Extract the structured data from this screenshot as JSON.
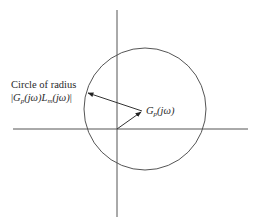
{
  "diagram": {
    "type": "nyquist-uncertainty-disk",
    "labels": {
      "circle_line1": "Circle of radius",
      "radius_expr": {
        "open_bar": "|",
        "G": "G",
        "G_sub": "p",
        "arg1": "(jω)",
        "L": "L",
        "L_sub": "m",
        "arg2": "(jω)",
        "close_bar": "|"
      },
      "point_expr": {
        "G": "G",
        "G_sub": "p",
        "arg": "(jω)"
      }
    },
    "geometry": {
      "origin": [
        117,
        129
      ],
      "real_axis": {
        "x1": 13,
        "x2": 248,
        "y": 129
      },
      "imag_axis": {
        "x": 117,
        "y1": 10,
        "y2": 217
      },
      "circle": {
        "cx": 145,
        "cy": 109,
        "r": 61
      },
      "point_Gp": [
        142,
        111
      ],
      "radius_arrow_end": [
        87,
        93
      ]
    },
    "colors": {
      "line": "#444444",
      "text": "#2a2a2a"
    }
  }
}
